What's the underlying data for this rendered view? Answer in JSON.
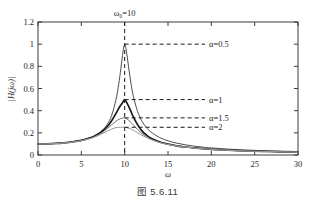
{
  "caption": "图 5.6.11",
  "chart_data": {
    "type": "line",
    "title": "",
    "xlabel": "ω",
    "ylabel": "|H(jω)|",
    "xlim": [
      0,
      30
    ],
    "ylim": [
      0,
      1.2
    ],
    "xticks": [
      0,
      5,
      10,
      15,
      20,
      25,
      30
    ],
    "xtick_labels": [
      "0",
      "5",
      "10",
      "15",
      "20",
      "25",
      "30"
    ],
    "yticks": [
      0,
      0.2,
      0.4,
      0.6,
      0.8,
      1.0,
      1.2
    ],
    "ytick_labels": [
      "0",
      "0.2",
      "0.4",
      "0.6",
      "0.8",
      "1",
      "1.2"
    ],
    "grid": false,
    "legend_position": "right-inline-annotations",
    "resonance_frequency": 10,
    "resonance_marker_label": "ω₀=10",
    "series": [
      {
        "name": "α=0.5",
        "alpha": 0.5,
        "peak_value": 1.0,
        "color": "#4d4d4d",
        "width": 1.0,
        "annotation": "α=0.5",
        "annotation_y": 1.0,
        "x": [
          0,
          1,
          2,
          3,
          4,
          5,
          6,
          6.5,
          7,
          7.5,
          8,
          8.5,
          9,
          9.25,
          9.5,
          9.75,
          10,
          10.25,
          10.5,
          10.75,
          11,
          11.5,
          12,
          12.5,
          13,
          14,
          15,
          16,
          17,
          18,
          19,
          20,
          22,
          24,
          26,
          28,
          30
        ],
        "values": [
          0.1,
          0.101,
          0.104,
          0.11,
          0.119,
          0.133,
          0.156,
          0.173,
          0.196,
          0.229,
          0.278,
          0.357,
          0.5,
          0.606,
          0.743,
          0.898,
          1.0,
          0.908,
          0.766,
          0.635,
          0.531,
          0.391,
          0.305,
          0.249,
          0.21,
          0.159,
          0.128,
          0.107,
          0.092,
          0.08,
          0.071,
          0.064,
          0.053,
          0.045,
          0.039,
          0.035,
          0.031
        ]
      },
      {
        "name": "α=1",
        "alpha": 1,
        "peak_value": 0.5,
        "color": "#1a1a1a",
        "width": 1.7,
        "annotation": "α=1",
        "annotation_y": 0.5,
        "x": [
          0,
          1,
          2,
          3,
          4,
          5,
          6,
          6.5,
          7,
          7.5,
          8,
          8.5,
          9,
          9.25,
          9.5,
          9.75,
          10,
          10.25,
          10.5,
          10.75,
          11,
          11.5,
          12,
          12.5,
          13,
          14,
          15,
          16,
          17,
          18,
          19,
          20,
          22,
          24,
          26,
          28,
          30
        ],
        "values": [
          0.1,
          0.101,
          0.104,
          0.11,
          0.119,
          0.132,
          0.154,
          0.17,
          0.191,
          0.219,
          0.257,
          0.309,
          0.376,
          0.412,
          0.444,
          0.472,
          0.5,
          0.471,
          0.432,
          0.388,
          0.344,
          0.272,
          0.218,
          0.181,
          0.154,
          0.119,
          0.098,
          0.083,
          0.072,
          0.064,
          0.057,
          0.051,
          0.043,
          0.037,
          0.033,
          0.029,
          0.026
        ]
      },
      {
        "name": "α=1.5",
        "alpha": 1.5,
        "peak_value": 0.335,
        "color": "#737373",
        "width": 1.0,
        "annotation": "α=1.5",
        "annotation_y": 0.335,
        "x": [
          0,
          1,
          2,
          3,
          4,
          5,
          6,
          6.5,
          7,
          7.5,
          8,
          8.5,
          9,
          9.25,
          9.5,
          9.75,
          10,
          10.25,
          10.5,
          10.75,
          11,
          11.5,
          12,
          12.5,
          13,
          14,
          15,
          16,
          17,
          18,
          19,
          20,
          22,
          24,
          26,
          28,
          30
        ],
        "values": [
          0.1,
          0.101,
          0.103,
          0.109,
          0.118,
          0.13,
          0.151,
          0.165,
          0.184,
          0.208,
          0.238,
          0.272,
          0.305,
          0.318,
          0.327,
          0.333,
          0.335,
          0.326,
          0.311,
          0.292,
          0.271,
          0.23,
          0.194,
          0.166,
          0.144,
          0.114,
          0.095,
          0.081,
          0.071,
          0.063,
          0.056,
          0.051,
          0.042,
          0.036,
          0.032,
          0.029,
          0.026
        ]
      },
      {
        "name": "α=2",
        "alpha": 2,
        "peak_value": 0.25,
        "color": "#9a9a9a",
        "width": 1.0,
        "annotation": "α=2",
        "annotation_y": 0.25,
        "x": [
          0,
          1,
          2,
          3,
          4,
          5,
          6,
          6.5,
          7,
          7.5,
          8,
          8.5,
          9,
          9.25,
          9.5,
          9.75,
          10,
          10.25,
          10.5,
          10.75,
          11,
          11.5,
          12,
          12.5,
          13,
          14,
          15,
          16,
          17,
          18,
          19,
          20,
          22,
          24,
          26,
          28,
          30
        ],
        "values": [
          0.1,
          0.1,
          0.103,
          0.108,
          0.117,
          0.129,
          0.148,
          0.161,
          0.177,
          0.196,
          0.216,
          0.234,
          0.247,
          0.249,
          0.25,
          0.25,
          0.25,
          0.247,
          0.241,
          0.233,
          0.223,
          0.201,
          0.178,
          0.158,
          0.14,
          0.113,
          0.095,
          0.082,
          0.071,
          0.063,
          0.057,
          0.051,
          0.042,
          0.036,
          0.032,
          0.029,
          0.026
        ]
      }
    ]
  }
}
